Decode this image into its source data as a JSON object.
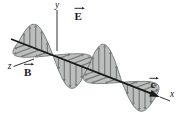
{
  "figure": {
    "labels": {
      "x_axis": "x",
      "y_axis": "y",
      "z_axis": "z",
      "e_vector": "E",
      "b_vector": "B",
      "c_vector": "c"
    },
    "colors": {
      "paper": "#ffffff",
      "ink": "#1a1a1a",
      "lobe_fill": "#b5b7b6",
      "lobe_stroke": "#666b6c",
      "field_arrow": "#737877"
    }
  }
}
